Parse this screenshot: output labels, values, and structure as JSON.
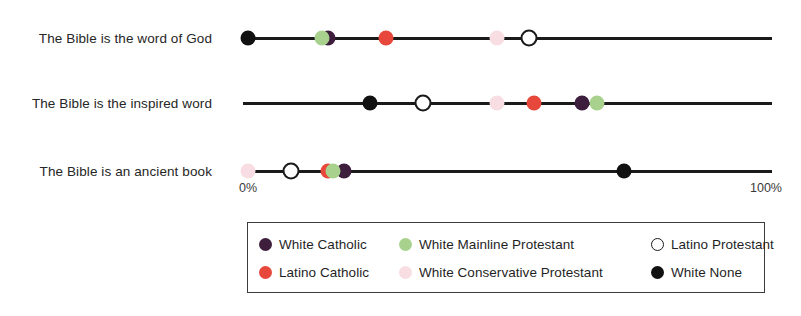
{
  "chart_data": {
    "type": "scatter",
    "title": "",
    "subtitle": "",
    "xlabel": "",
    "ylabel": "",
    "xlim": [
      0,
      100
    ],
    "grid": false,
    "legend_position": "bottom",
    "tick_labels": {
      "left": "0%",
      "right": "100%"
    },
    "categories": [
      "The Bible is the word of God",
      "The Bible is the inspired word",
      "The Bible is an ancient book"
    ],
    "series": [
      {
        "name": "White Catholic",
        "color": "#3d1f3d",
        "marker": "filled-circle",
        "values": [
          16,
          64,
          19
        ]
      },
      {
        "name": "Latino Catholic",
        "color": "#e8483c",
        "marker": "filled-circle",
        "values": [
          27,
          55,
          16
        ]
      },
      {
        "name": "White Mainline Protestant",
        "color": "#a9d18e",
        "marker": "filled-circle",
        "values": [
          15,
          67,
          17
        ]
      },
      {
        "name": "White Conservative Protestant",
        "color": "#f8dee2",
        "marker": "filled-circle",
        "values": [
          48,
          48,
          1
        ]
      },
      {
        "name": "Latino Protestant",
        "color": "#ffffff",
        "marker": "hollow-circle",
        "values": [
          54,
          34,
          9
        ]
      },
      {
        "name": "White None",
        "color": "#111111",
        "marker": "filled-circle",
        "values": [
          1,
          24,
          72
        ]
      }
    ]
  },
  "legend": {
    "items": [
      {
        "label": "White Catholic",
        "color": "#3d1f3d",
        "marker": "filled-circle"
      },
      {
        "label": "Latino Catholic",
        "color": "#e8483c",
        "marker": "filled-circle"
      },
      {
        "label": "White Mainline Protestant",
        "color": "#a9d18e",
        "marker": "filled-circle"
      },
      {
        "label": "White Conservative Protestant",
        "color": "#f8dee2",
        "marker": "filled-circle"
      },
      {
        "label": "Latino Protestant",
        "color": "#ffffff",
        "marker": "hollow-circle"
      },
      {
        "label": "White None",
        "color": "#111111",
        "marker": "filled-circle"
      }
    ]
  }
}
